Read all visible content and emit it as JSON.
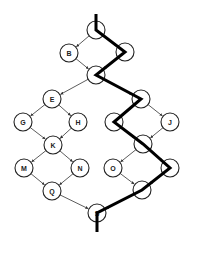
{
  "diagram": {
    "type": "directed-graph",
    "nodes": [
      {
        "id": "A",
        "label": "",
        "x": 96,
        "y": 30
      },
      {
        "id": "B",
        "label": "B",
        "x": 69,
        "y": 53
      },
      {
        "id": "C",
        "label": "",
        "x": 125,
        "y": 52
      },
      {
        "id": "D",
        "label": "",
        "x": 96,
        "y": 75
      },
      {
        "id": "E",
        "label": "E",
        "x": 52,
        "y": 99
      },
      {
        "id": "F",
        "label": "",
        "x": 141,
        "y": 99
      },
      {
        "id": "G",
        "label": "G",
        "x": 23,
        "y": 122
      },
      {
        "id": "H",
        "label": "H",
        "x": 78,
        "y": 122
      },
      {
        "id": "I",
        "label": "",
        "x": 114,
        "y": 122
      },
      {
        "id": "J",
        "label": "J",
        "x": 170,
        "y": 122
      },
      {
        "id": "K",
        "label": "K",
        "x": 53,
        "y": 145
      },
      {
        "id": "L",
        "label": "",
        "x": 143,
        "y": 144
      },
      {
        "id": "M",
        "label": "M",
        "x": 24,
        "y": 168
      },
      {
        "id": "N",
        "label": "N",
        "x": 80,
        "y": 168
      },
      {
        "id": "O",
        "label": "O",
        "x": 113,
        "y": 168
      },
      {
        "id": "P",
        "label": "",
        "x": 170,
        "y": 168
      },
      {
        "id": "Q",
        "label": "Q",
        "x": 52,
        "y": 191
      },
      {
        "id": "R",
        "label": "",
        "x": 142,
        "y": 190
      },
      {
        "id": "S",
        "label": "S",
        "x": 97,
        "y": 213
      }
    ],
    "edges": [
      [
        "A",
        "B"
      ],
      [
        "A",
        "C"
      ],
      [
        "B",
        "D"
      ],
      [
        "C",
        "D"
      ],
      [
        "D",
        "E"
      ],
      [
        "D",
        "F"
      ],
      [
        "E",
        "G"
      ],
      [
        "E",
        "H"
      ],
      [
        "G",
        "K"
      ],
      [
        "H",
        "K"
      ],
      [
        "K",
        "M"
      ],
      [
        "K",
        "N"
      ],
      [
        "M",
        "Q"
      ],
      [
        "N",
        "Q"
      ],
      [
        "Q",
        "S"
      ],
      [
        "F",
        "I"
      ],
      [
        "F",
        "J"
      ],
      [
        "I",
        "L"
      ],
      [
        "J",
        "L"
      ],
      [
        "L",
        "O"
      ],
      [
        "L",
        "P"
      ],
      [
        "O",
        "R"
      ],
      [
        "P",
        "R"
      ],
      [
        "R",
        "S"
      ]
    ],
    "highlighted_path": {
      "nodes": [
        "A",
        "C",
        "D",
        "F",
        "I",
        "L",
        "P",
        "R",
        "S"
      ],
      "start": {
        "x": 96,
        "y": 14
      },
      "end": {
        "x": 97,
        "y": 232
      },
      "color": "#000000"
    },
    "node_radius": 9
  }
}
